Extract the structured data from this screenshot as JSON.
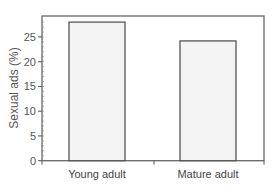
{
  "chart_data": {
    "type": "bar",
    "title": "",
    "xlabel": "",
    "ylabel": "Sexual ads (%)",
    "categories": [
      "Young adult",
      "Mature adult"
    ],
    "values": [
      28,
      24.2
    ],
    "ylim": [
      0,
      29
    ],
    "yticks": [
      0,
      5,
      10,
      15,
      20,
      25
    ],
    "ytick_labels": [
      "0",
      "5",
      "10",
      "15",
      "20",
      "25"
    ],
    "grid": false,
    "legend": null,
    "colors": {
      "bar_fill": "#f4f4f4",
      "bar_edge": "#555555",
      "axis": "#555555"
    }
  }
}
